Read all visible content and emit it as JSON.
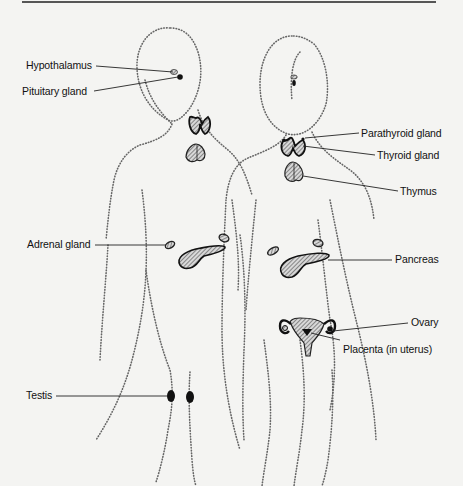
{
  "diagram": {
    "colors": {
      "background": "#f4f4f2",
      "ink": "#111111",
      "outline_dots": "#555555",
      "gland_fill": "#b8b8b8"
    },
    "labels": {
      "hypothalamus": "Hypothalamus",
      "pituitary": "Pituitary gland",
      "parathyroid": "Parathyroid gland",
      "thyroid": "Thyroid gland",
      "thymus": "Thymus",
      "adrenal": "Adrenal gland",
      "pancreas": "Pancreas",
      "ovary": "Ovary",
      "placenta": "Placenta (in uterus)",
      "testis": "Testis"
    },
    "figures": [
      {
        "name": "male",
        "glands": [
          "hypothalamus",
          "pituitary",
          "thyroid",
          "thymus",
          "adrenal",
          "pancreas",
          "testis"
        ]
      },
      {
        "name": "female",
        "glands": [
          "pituitary",
          "parathyroid",
          "thyroid",
          "thymus",
          "adrenal",
          "pancreas",
          "ovary",
          "placenta"
        ]
      }
    ]
  }
}
